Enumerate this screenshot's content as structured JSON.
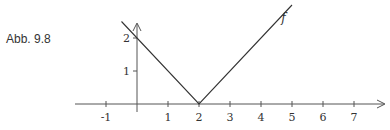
{
  "caption": "Abb. 9.8",
  "chart_data": {
    "type": "line",
    "title": "",
    "xlabel": "",
    "ylabel": "",
    "series": [
      {
        "name": "f",
        "formula": "f(x) = |x - 2|",
        "x": [
          -0.5,
          2,
          5
        ],
        "y": [
          2.5,
          0,
          3
        ]
      }
    ],
    "x_ticks": [
      -1,
      1,
      2,
      3,
      4,
      5,
      6,
      7
    ],
    "x_tick_labels": [
      "-1",
      "1",
      "2",
      "3",
      "4",
      "5",
      "6",
      "7"
    ],
    "y_ticks": [
      1,
      2
    ],
    "y_tick_labels": [
      "1",
      "2"
    ],
    "xlim": [
      -1.7,
      8
    ],
    "ylim": [
      0,
      2.5
    ],
    "grid": false,
    "legend": "none",
    "annotations": [
      {
        "text": "f",
        "x": 4.85,
        "y": 2.6
      }
    ],
    "colors": {
      "line": "#333333",
      "axis": "#555555"
    }
  }
}
